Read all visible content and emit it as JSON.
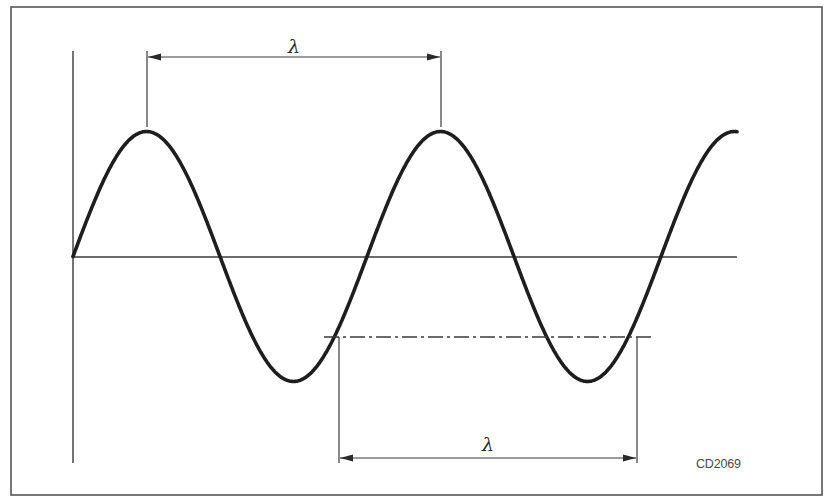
{
  "figure": {
    "type": "sine-wave-wavelength-diagram",
    "code_label": "CD2069",
    "top_dimension_label": "λ",
    "bottom_dimension_label": "λ",
    "colors": {
      "wave": "#1e1e1e",
      "lines": "#3a3a3a",
      "frame": "#555555",
      "label": "#4a4a4a",
      "background": "#ffffff"
    }
  },
  "geometry": {
    "frame": {
      "x": 11,
      "y": 7,
      "width": 811,
      "height": 488
    },
    "vertical_axis": {
      "x": 73,
      "y1": 51,
      "y2": 463
    },
    "horizontal_axis": {
      "y": 257,
      "x1": 73,
      "x2": 737
    },
    "wave": {
      "x_start": 73,
      "x_end": 737,
      "baseline_y": 256.5,
      "amplitude": 125,
      "wavelength": 294,
      "phase": "sine starting at zero, rising"
    },
    "top_dimension": {
      "x1": 147,
      "x2": 441,
      "y": 57,
      "tick_top": 51,
      "tick_bottom": 127,
      "label_x": 294,
      "label_y": 53
    },
    "bottom_dimension": {
      "x1": 339,
      "x2": 637,
      "y": 458,
      "tick_top": 337,
      "tick_bottom": 463,
      "label_x": 488,
      "label_y": 451
    },
    "centerline": {
      "y": 337,
      "x1": 324,
      "x2": 652
    }
  }
}
